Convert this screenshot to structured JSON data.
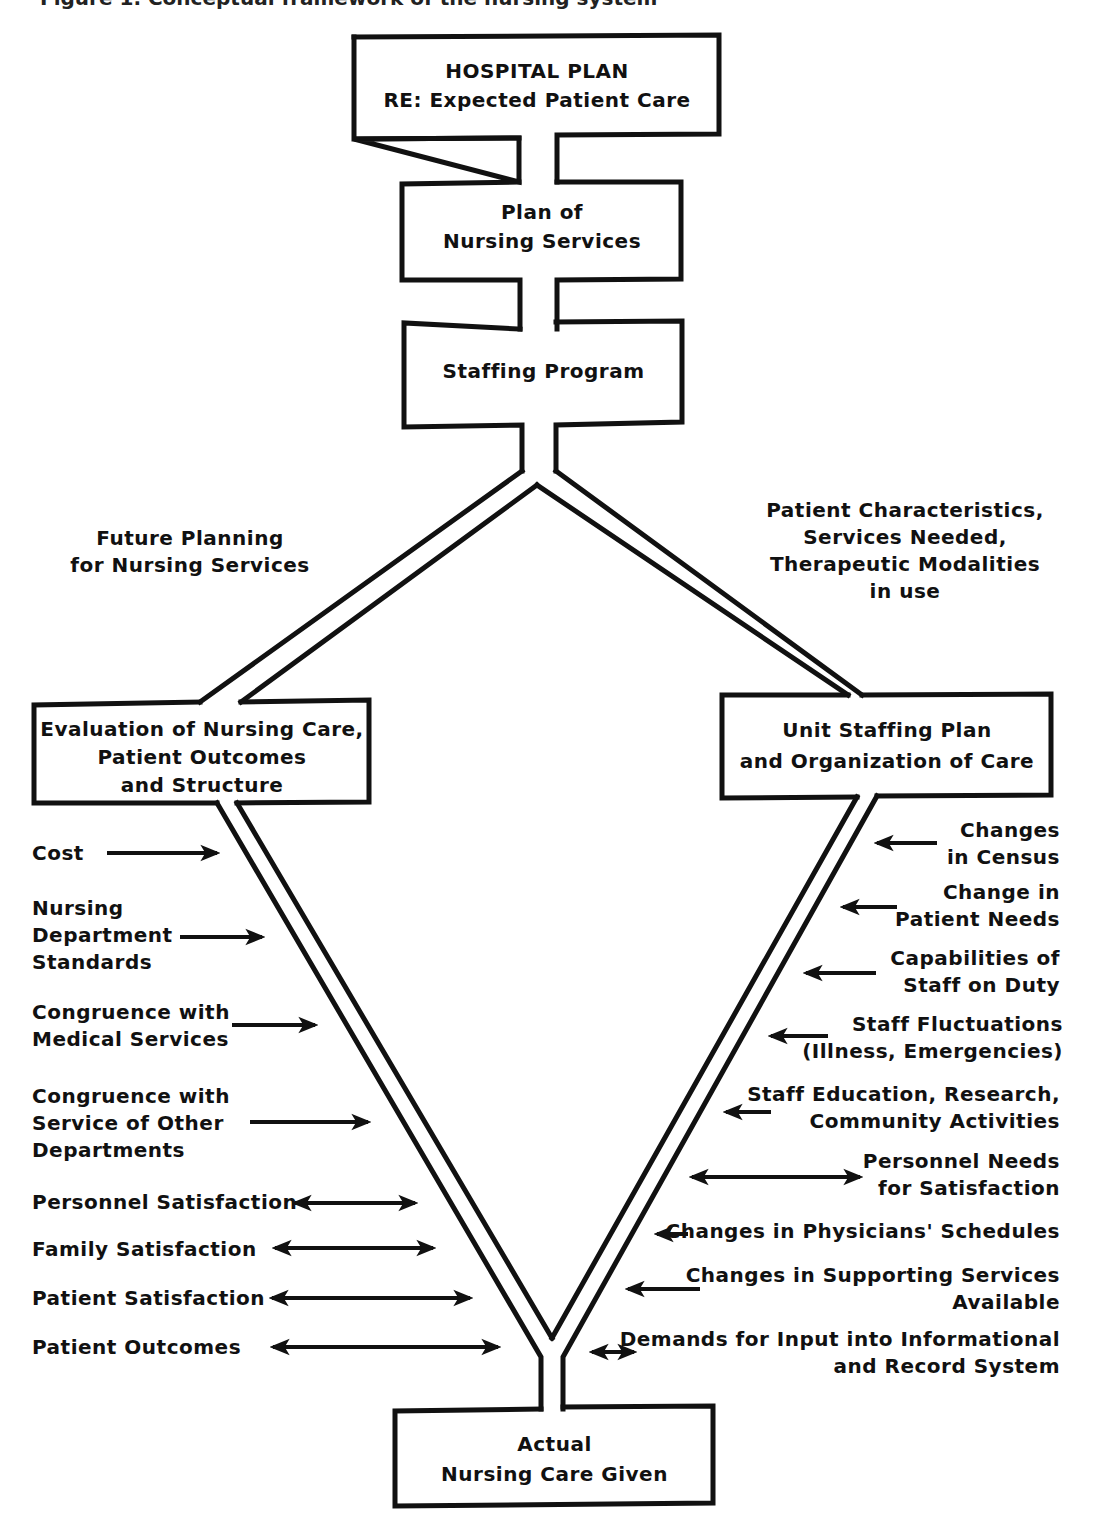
{
  "caption_partial": "Figure 1. Conceptual framework of the nursing system",
  "boxes": {
    "hospital_plan": {
      "lines": [
        "HOSPITAL PLAN",
        "RE:  Expected Patient Care"
      ]
    },
    "plan_nursing": {
      "lines": [
        "Plan of",
        "Nursing Services"
      ]
    },
    "staffing_program": {
      "lines": [
        "Staffing Program"
      ]
    },
    "evaluation": {
      "lines": [
        "Evaluation of Nursing Care,",
        "Patient Outcomes",
        "and Structure"
      ]
    },
    "unit_staffing": {
      "lines": [
        "Unit Staffing Plan",
        "and Organization of Care"
      ]
    },
    "actual_care": {
      "lines": [
        "Actual",
        "Nursing Care Given"
      ]
    }
  },
  "branch_labels": {
    "left": [
      "Future Planning",
      "for Nursing Services"
    ],
    "right": [
      "Patient Characteristics,",
      "Services Needed,",
      "Therapeutic Modalities",
      "in use"
    ]
  },
  "left_factors": [
    {
      "lines": [
        "Cost"
      ],
      "arrow": "right"
    },
    {
      "lines": [
        "Nursing",
        "Department",
        "Standards"
      ],
      "arrow": "right"
    },
    {
      "lines": [
        "Congruence with",
        "Medical Services"
      ],
      "arrow": "right"
    },
    {
      "lines": [
        "Congruence with",
        "Service of Other",
        "Departments"
      ],
      "arrow": "right"
    },
    {
      "lines": [
        "Personnel Satisfaction"
      ],
      "arrow": "both"
    },
    {
      "lines": [
        "Family Satisfaction"
      ],
      "arrow": "both"
    },
    {
      "lines": [
        "Patient Satisfaction"
      ],
      "arrow": "both"
    },
    {
      "lines": [
        "Patient Outcomes"
      ],
      "arrow": "both"
    }
  ],
  "right_factors": [
    {
      "lines": [
        "Changes",
        "in Census"
      ],
      "arrow": "left"
    },
    {
      "lines": [
        "Change in",
        "Patient Needs"
      ],
      "arrow": "left"
    },
    {
      "lines": [
        "Capabilities of",
        "Staff on Duty"
      ],
      "arrow": "left"
    },
    {
      "lines": [
        "Staff Fluctuations",
        "(Illness, Emergencies)"
      ],
      "arrow": "left"
    },
    {
      "lines": [
        "Staff Education, Research,",
        "Community Activities"
      ],
      "arrow": "left"
    },
    {
      "lines": [
        "Personnel Needs",
        "for Satisfaction"
      ],
      "arrow": "both"
    },
    {
      "lines": [
        "Changes in Physicians' Schedules"
      ],
      "arrow": "left"
    },
    {
      "lines": [
        "Changes in Supporting Services",
        "Available"
      ],
      "arrow": "left"
    },
    {
      "lines": [
        "Demands for Input into Informational",
        "and Record System"
      ],
      "arrow": "both"
    }
  ],
  "colors": {
    "ink": "#111111",
    "paper": "#ffffff"
  }
}
